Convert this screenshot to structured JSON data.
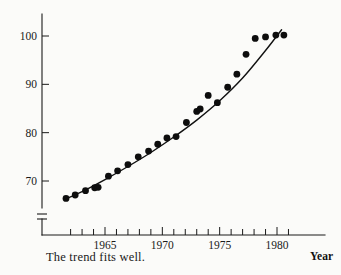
{
  "chart_data": {
    "type": "scatter",
    "title": "",
    "subtitle": "",
    "xlabel": "Year",
    "ylabel": "",
    "caption": "The trend fits well.",
    "xlim": [
      1961,
      1981.6
    ],
    "ylim": [
      65.5,
      101.5
    ],
    "y_axis_break": true,
    "grid": false,
    "legend": null,
    "ytick_labels": [
      "100",
      "90",
      "80",
      "70"
    ],
    "ytick_values": [
      100,
      90,
      80,
      70
    ],
    "xtick_labels": [
      "1965",
      "1970",
      "1975",
      "1980"
    ],
    "xtick_values": [
      1965,
      1970,
      1975,
      1980
    ],
    "xtick_minor_values": [
      1962,
      1963,
      1964,
      1966,
      1967,
      1968,
      1969,
      1971,
      1972,
      1973,
      1974,
      1976,
      1977,
      1978,
      1979,
      1981
    ],
    "x": [
      1961.6,
      1962.4,
      1963.3,
      1964.1,
      1964.4,
      1965.3,
      1966.1,
      1967.0,
      1967.9,
      1968.8,
      1969.6,
      1970.4,
      1971.2,
      1972.1,
      1973.0,
      1973.3,
      1974.0,
      1974.8,
      1975.7,
      1976.5,
      1977.3,
      1978.1,
      1979.0,
      1979.9,
      1980.6
    ],
    "y": [
      66.4,
      67.1,
      68.0,
      68.6,
      68.7,
      71.0,
      72.1,
      73.4,
      75.0,
      76.2,
      77.6,
      78.9,
      79.2,
      82.1,
      84.4,
      84.9,
      87.7,
      86.2,
      89.4,
      92.1,
      96.2,
      99.5,
      99.8,
      100.2,
      100.2
    ],
    "series": [
      {
        "name": "observations",
        "marker": "filled-circle",
        "color": "#0d0d0d",
        "values": [
          66.4,
          67.1,
          68.0,
          68.6,
          68.7,
          71.0,
          72.1,
          73.4,
          75.0,
          76.2,
          77.6,
          78.9,
          79.2,
          82.1,
          84.4,
          84.9,
          87.7,
          86.2,
          89.4,
          92.1,
          96.2,
          99.5,
          99.8,
          100.2,
          100.2
        ]
      },
      {
        "name": "fitted-trend",
        "marker": "line",
        "color": "#111111",
        "x": [
          1961.5,
          1963.0,
          1965.0,
          1967.0,
          1969.0,
          1971.0,
          1973.0,
          1975.0,
          1977.0,
          1979.0,
          1980.4
        ],
        "values": [
          66.2,
          67.8,
          70.3,
          73.0,
          75.9,
          79.1,
          82.6,
          86.6,
          91.3,
          97.0,
          101.3
        ]
      }
    ],
    "annotations": []
  }
}
